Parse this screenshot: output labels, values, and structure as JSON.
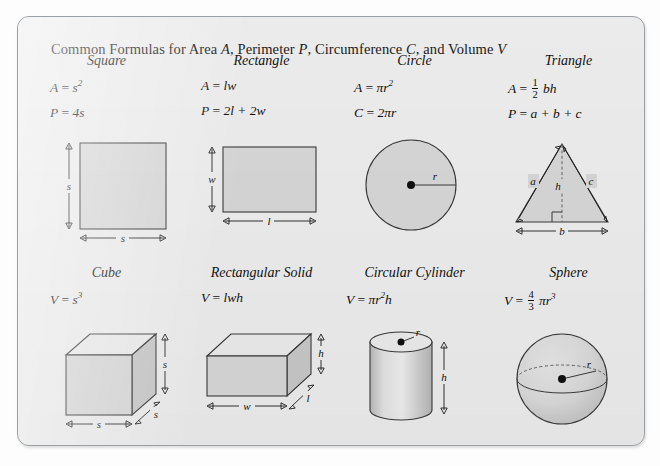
{
  "card": {
    "title_prefix": "Common Formulas for Area ",
    "title_a": "A",
    "title_mid1": ", Perimeter ",
    "title_p": "P",
    "title_mid2": ", Circumference ",
    "title_c": "C",
    "title_mid3": ", and Volume ",
    "title_v": "V",
    "border_color": "#9aa0a4",
    "background_color": "#eeeeee",
    "shape_fill": "#d8d8d8",
    "shape_stroke": "#3a3a3a"
  },
  "figures": [
    {
      "name": "square",
      "heading": "Square",
      "formulas": [
        {
          "lhs": "A",
          "eq": "=",
          "rhs_base": "s",
          "rhs_sup": "2"
        },
        {
          "lhs": "P",
          "eq": "=",
          "rhs_base": "4s",
          "rhs_sup": ""
        }
      ],
      "labels": {
        "side_left": "s",
        "side_bottom": "s"
      }
    },
    {
      "name": "rectangle",
      "heading": "Rectangle",
      "formulas": [
        {
          "lhs": "A",
          "eq": "=",
          "rhs_base": "lw",
          "rhs_sup": ""
        },
        {
          "lhs": "P",
          "eq": "=",
          "rhs_base": "2l + 2w",
          "rhs_sup": ""
        }
      ],
      "labels": {
        "width_left": "w",
        "length_bottom": "l"
      }
    },
    {
      "name": "circle",
      "heading": "Circle",
      "formulas": [
        {
          "lhs": "A",
          "eq": "=",
          "rhs_base": "πr",
          "rhs_sup": "2"
        },
        {
          "lhs": "C",
          "eq": "=",
          "rhs_base": "2πr",
          "rhs_sup": ""
        }
      ],
      "labels": {
        "radius": "r"
      }
    },
    {
      "name": "triangle",
      "heading": "Triangle",
      "formulas": [
        {
          "lhs": "A",
          "eq": "=",
          "frac_num": "1",
          "frac_den": "2",
          "rhs_base": "bh",
          "rhs_sup": ""
        },
        {
          "lhs": "P",
          "eq": "=",
          "rhs_base": "a + b + c",
          "rhs_sup": ""
        }
      ],
      "labels": {
        "side_a": "a",
        "side_c": "c",
        "height": "h",
        "base": "b"
      }
    },
    {
      "name": "cube",
      "heading": "Cube",
      "formulas": [
        {
          "lhs": "V",
          "eq": "=",
          "rhs_base": "s",
          "rhs_sup": "3"
        }
      ],
      "labels": {
        "height_right": "s",
        "depth": "s",
        "width_bottom": "s"
      }
    },
    {
      "name": "rectangular-solid",
      "heading": "Rectangular Solid",
      "formulas": [
        {
          "lhs": "V",
          "eq": "=",
          "rhs_base": "lwh",
          "rhs_sup": ""
        }
      ],
      "labels": {
        "height_right": "h",
        "length_depth": "l",
        "width_bottom": "w"
      }
    },
    {
      "name": "circular-cylinder",
      "heading": "Circular Cylinder",
      "formulas": [
        {
          "lhs": "V",
          "eq": "=",
          "rhs_base": "πr",
          "rhs_sup": "2",
          "rhs_tail": "h"
        }
      ],
      "labels": {
        "radius": "r",
        "height": "h"
      }
    },
    {
      "name": "sphere",
      "heading": "Sphere",
      "formulas": [
        {
          "lhs": "V",
          "eq": "=",
          "frac_num": "4",
          "frac_den": "3",
          "rhs_base": "πr",
          "rhs_sup": "3"
        }
      ],
      "labels": {
        "radius": "r"
      }
    }
  ]
}
